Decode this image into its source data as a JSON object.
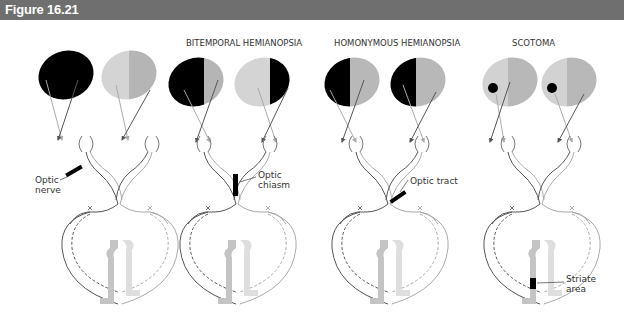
{
  "figure": {
    "title": "Figure 16.21"
  },
  "panels": [
    {
      "id": "normal-lesion",
      "title": "",
      "lesion_label": "Optic\nnerve",
      "lesion_label_line1": "Optic",
      "lesion_label_line2": "nerve"
    },
    {
      "id": "bitemporal",
      "title": "BITEMPORAL HEMIANOPSIA",
      "lesion_label_line1": "Optic",
      "lesion_label_line2": "chiasm"
    },
    {
      "id": "homonymous",
      "title": "HOMONYMOUS HEMIANOPSIA",
      "lesion_label_line1": "Optic tract",
      "lesion_label_line2": ""
    },
    {
      "id": "scotoma",
      "title": "SCOTOMA",
      "lesion_label_line1": "Striate",
      "lesion_label_line2": "area"
    }
  ],
  "colors": {
    "title_bar": "#6f6f6f",
    "blind_field": "#000000",
    "left_field": "#d0d0d0",
    "right_field": "#b4b4b4",
    "cortex_left": "#bdbdbd",
    "cortex_right": "#dcdcdc"
  }
}
